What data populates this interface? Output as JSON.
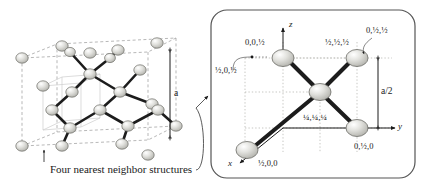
{
  "figure": {
    "background_color": "#ffffff",
    "ink_color": "#1a1a1a",
    "atom_fill": "#d8d8d4",
    "bond_color": "#1c1c1c"
  },
  "left_panel": {
    "name": "diamond-cubic-unit-cell",
    "lattice_constant_label": "a",
    "caption": "Four nearest neighbor structures"
  },
  "right_panel": {
    "name": "nearest-neighbor-detail",
    "border_color": "#555555",
    "axes": {
      "z": "z",
      "y": "y",
      "x": "x"
    },
    "dimension_label": "a/2",
    "atoms": [
      {
        "id": "top-left-atom",
        "label": "0,0,½"
      },
      {
        "id": "top-right-atom",
        "label": "½,½,½"
      },
      {
        "id": "callout-atom",
        "label": "0,½,½"
      },
      {
        "id": "left-ghost-atom",
        "label": "½,0,½"
      },
      {
        "id": "center-atom",
        "label": "¼,¼,¼"
      },
      {
        "id": "bottom-left-atom",
        "label": "½,0,0"
      },
      {
        "id": "bottom-right-atom",
        "label": "0,½,0"
      }
    ]
  }
}
